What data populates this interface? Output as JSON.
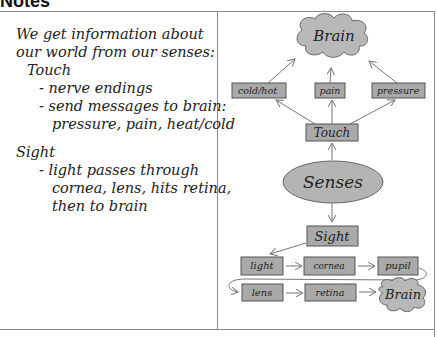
{
  "page": {
    "title": "Notes"
  },
  "notes": {
    "lines": [
      "We get information about",
      "our world from our senses:",
      "Touch",
      "- nerve endings",
      "- send messages to brain:",
      "pressure, pain, heat/cold",
      "Sight",
      "- light passes through",
      "cornea, lens, hits retina,",
      "then to brain"
    ]
  },
  "diagram": {
    "center": "Senses",
    "touch": {
      "label": "Touch",
      "outputs": [
        "cold/hot",
        "pain",
        "pressure"
      ],
      "target": "Brain"
    },
    "sight": {
      "label": "Sight",
      "path_row1": [
        "light",
        "cornea",
        "pupil"
      ],
      "path_row2": [
        "lens",
        "retina"
      ],
      "target": "Brain"
    }
  },
  "colors": {
    "box_fill": "#a9a9a9",
    "box_stroke": "#555555",
    "ellipse_fill": "#b4b4b4",
    "cloud_fill": "#b8b8b8",
    "line": "#777777",
    "text": "#222222"
  }
}
